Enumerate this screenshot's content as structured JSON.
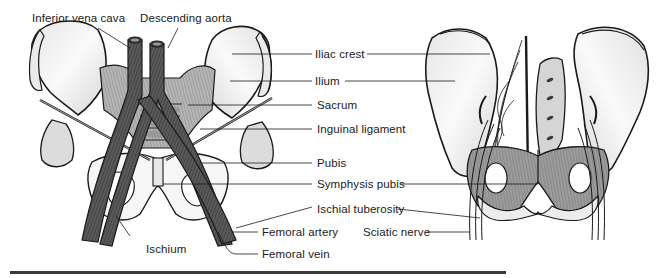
{
  "figure": {
    "left_view": {
      "name": "anterior-view-pelvis",
      "labels": {
        "inferior_vena_cava": "Inferior vena cava",
        "descending_aorta": "Descending aorta",
        "ischium": "Ischium",
        "femoral_artery": "Femoral artery",
        "femoral_vein": "Femoral vein"
      }
    },
    "center_labels": {
      "iliac_crest": "Iliac crest",
      "ilium": "Ilium",
      "sacrum": "Sacrum",
      "inguinal_ligament": "Inguinal ligament",
      "pubis": "Pubis",
      "symphysis_pubis": "Symphysis pubis",
      "ischial_tuberosity": "Ischial tuberosity"
    },
    "right_view": {
      "name": "posterior-view-pelvis",
      "labels": {
        "sciatic_nerve": "Sciatic nerve"
      }
    },
    "colors": {
      "line": "#1a1a1a",
      "vessel_dark": "#4a4a4a",
      "vessel_mid": "#6b6b6b",
      "bone_fill": "#f2f2f2",
      "bone_shade": "#d9d9d9",
      "muscle": "#9a9a9a",
      "rule": "#3a3a3a"
    }
  }
}
